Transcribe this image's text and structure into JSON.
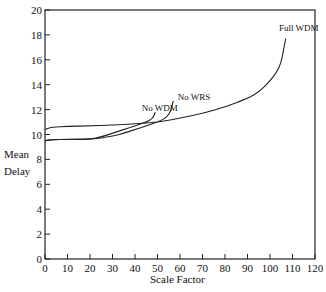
{
  "chart_data": {
    "type": "line",
    "title": "",
    "xlabel": "Scale Factor",
    "ylabel": "Mean Delay",
    "xlim": [
      0,
      120
    ],
    "ylim": [
      0,
      20
    ],
    "xticks": [
      0,
      10,
      20,
      30,
      40,
      50,
      60,
      70,
      80,
      90,
      100,
      110,
      120
    ],
    "yticks": [
      0,
      2,
      4,
      6,
      8,
      10,
      12,
      14,
      16,
      18,
      20
    ],
    "grid": false,
    "legend": "inline labels at curve ends",
    "series": [
      {
        "name": "Full WDM",
        "x": [
          0,
          3,
          10,
          20,
          30,
          40,
          50,
          60,
          70,
          80,
          90,
          95,
          100,
          103,
          105,
          106,
          107
        ],
        "y": [
          10.4,
          10.6,
          10.65,
          10.7,
          10.75,
          10.85,
          11.0,
          11.3,
          11.7,
          12.2,
          12.9,
          13.4,
          14.3,
          15.0,
          15.8,
          16.8,
          17.7
        ]
      },
      {
        "name": "No WDM",
        "x": [
          0,
          3,
          10,
          20,
          25,
          30,
          35,
          40,
          45,
          48,
          49
        ],
        "y": [
          9.5,
          9.6,
          9.6,
          9.65,
          9.8,
          10.1,
          10.4,
          10.7,
          11.0,
          11.3,
          11.8
        ]
      },
      {
        "name": "No WRS",
        "x": [
          0,
          3,
          10,
          20,
          30,
          35,
          40,
          45,
          50,
          54,
          56,
          57
        ],
        "y": [
          9.5,
          9.6,
          9.6,
          9.6,
          9.85,
          10.1,
          10.4,
          10.7,
          11.0,
          11.35,
          11.9,
          12.7
        ]
      }
    ],
    "annotations": [
      {
        "text": "Full WDM",
        "x": 104,
        "y": 18.3
      },
      {
        "text": "No WDM",
        "x": 43,
        "y": 11.9
      },
      {
        "text": "No WRS",
        "x": 59,
        "y": 12.8
      }
    ]
  },
  "labels": {
    "ylabel_line1": "Mean",
    "ylabel_line2": "Delay",
    "xlabel": "Scale Factor"
  }
}
